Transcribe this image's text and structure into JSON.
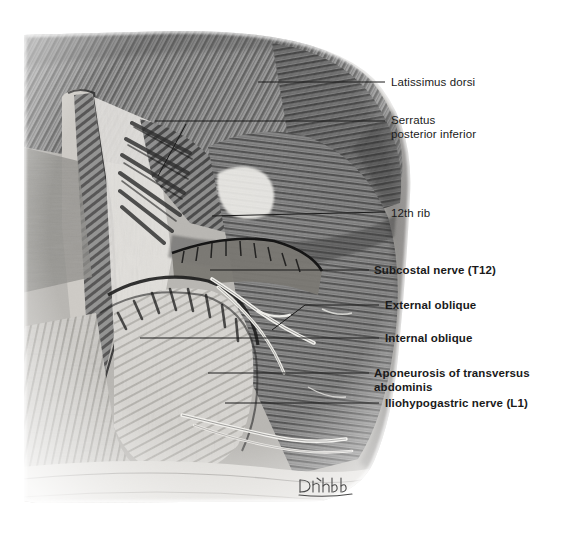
{
  "figure": {
    "kind": "anatomical-illustration",
    "medium": "graphite pencil drawing, grayscale",
    "background_color": "#ffffff",
    "ink_color": "#1a1a1a",
    "signature": "D. Rubb"
  },
  "labels": [
    {
      "id": "latissimus-dorsi",
      "text": "Latissimus dorsi",
      "weight": "regular",
      "text_x": 391,
      "text_y": 75,
      "leader": {
        "x1": 258,
        "y1": 82,
        "x2": 385,
        "y2": 82
      }
    },
    {
      "id": "serratus-posterior-inferior",
      "text": "Serratus\nposterior inferior",
      "weight": "regular",
      "text_x": 391,
      "text_y": 113,
      "leader": {
        "x1": 155,
        "y1": 121,
        "x2": 385,
        "y2": 121
      },
      "branch": {
        "x1": 186,
        "y1": 124,
        "x2": 158,
        "y2": 176
      }
    },
    {
      "id": "twelfth-rib",
      "text": "12th rib",
      "weight": "regular",
      "text_x": 391,
      "text_y": 206,
      "leader": {
        "x1": 212,
        "y1": 216,
        "x2": 385,
        "y2": 212
      }
    },
    {
      "id": "subcostal-nerve-t12",
      "text": "Subcostal nerve (T12)",
      "weight": "bold",
      "text_x": 374,
      "text_y": 263,
      "leader": {
        "x1": 210,
        "y1": 270,
        "x2": 369,
        "y2": 270
      }
    },
    {
      "id": "external-oblique",
      "text": "External oblique",
      "weight": "bold",
      "text_x": 385,
      "text_y": 298,
      "leader": {
        "x1": 305,
        "y1": 305,
        "x2": 379,
        "y2": 305
      },
      "branch": {
        "x1": 305,
        "y1": 305,
        "x2": 272,
        "y2": 330
      }
    },
    {
      "id": "internal-oblique",
      "text": "Internal oblique",
      "weight": "bold",
      "text_x": 385,
      "text_y": 331,
      "leader": {
        "x1": 140,
        "y1": 338,
        "x2": 379,
        "y2": 338
      }
    },
    {
      "id": "aponeurosis-of-transversus-abdominis",
      "text": "Aponeurosis of transversus abdominis",
      "weight": "bold",
      "text_x": 374,
      "text_y": 366,
      "leader": {
        "x1": 208,
        "y1": 373,
        "x2": 369,
        "y2": 373
      }
    },
    {
      "id": "iliohypogastric-nerve-l1",
      "text": "Iliohypogastric nerve (L1)",
      "weight": "bold",
      "text_x": 385,
      "text_y": 396,
      "leader": {
        "x1": 225,
        "y1": 403,
        "x2": 379,
        "y2": 403
      }
    }
  ]
}
